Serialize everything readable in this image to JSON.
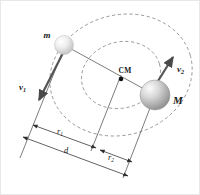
{
  "figure": {
    "background_color": "#ffffff",
    "border_color": "#e8e8e8"
  },
  "bodies": [
    {
      "id": "small-mass",
      "label": "m",
      "role": "orbiting smaller mass",
      "fill_light": "#fdfdfd",
      "fill_dark": "#c2c2c2",
      "radius_px": 9.5,
      "center": {
        "x": 63,
        "y": 44
      }
    },
    {
      "id": "large-mass",
      "label": "M",
      "role": "orbiting larger mass",
      "fill_light": "#f2f2f2",
      "fill_dark": "#8e8e8e",
      "radius_px": 15,
      "center": {
        "x": 154,
        "y": 94
      }
    }
  ],
  "center_of_mass": {
    "label": "CM",
    "dot_color": "#111111",
    "position": {
      "x": 120,
      "y": 74
    }
  },
  "velocity_vectors": [
    {
      "id": "v1",
      "label": "v",
      "subscript": "1",
      "belongs_to": "m",
      "direction": "down-left",
      "color": "#555555"
    },
    {
      "id": "v2",
      "label": "v",
      "subscript": "2",
      "belongs_to": "M",
      "direction": "up-right",
      "color": "#555555"
    }
  ],
  "orbits": [
    {
      "id": "outer-orbit",
      "description": "dashed orbit of m about CM",
      "stroke": "#8a8a8a",
      "dashed": true
    },
    {
      "id": "inner-orbit",
      "description": "dashed orbit of M about CM",
      "stroke": "#8a8a8a",
      "dashed": true
    }
  ],
  "dimensions": [
    {
      "id": "r1",
      "label": "r",
      "subscript": "1",
      "description": "distance from m to CM",
      "arrows": "both-ends"
    },
    {
      "id": "r2",
      "label": "r",
      "subscript": "2",
      "description": "distance from CM to M",
      "arrows": "both-ends"
    },
    {
      "id": "d",
      "label": "d",
      "subscript": "",
      "description": "total separation between m and M",
      "arrows": "both-ends"
    }
  ]
}
